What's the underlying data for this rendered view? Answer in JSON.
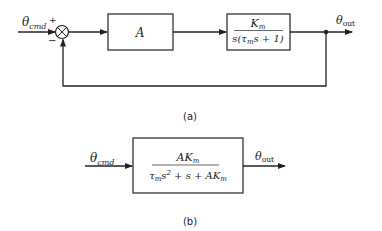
{
  "diagram_a": {
    "input_label": "θ",
    "input_sub": "cmd",
    "plus_sign": "+",
    "minus_sign": "−",
    "block1": "A",
    "block2_num": "K",
    "block2_num_sub": "m",
    "block2_den": "s(τ",
    "block2_den_sub": "m",
    "block2_den_rest": "s + 1)",
    "output_label": "θ",
    "output_sub": "out",
    "caption": "(a)"
  },
  "diagram_b": {
    "input_label": "θ",
    "input_sub": "cmd",
    "num": "AK",
    "num_sub": "m",
    "den_a": "τ",
    "den_a_sub": "m",
    "den_b": "s",
    "den_b_sup": "2",
    "den_c": " + s + AK",
    "den_c_sub": "m",
    "output_label": "θ",
    "output_sub": "out",
    "caption": "(b)"
  },
  "colors": {
    "stroke": "#222222",
    "background": "#ffffff"
  }
}
